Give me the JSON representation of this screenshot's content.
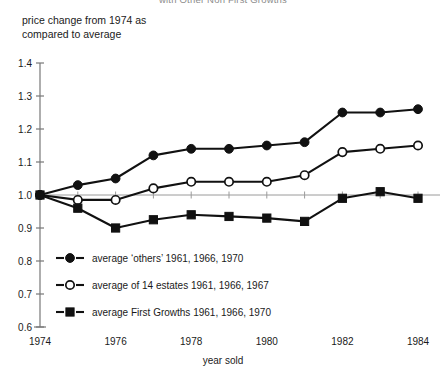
{
  "title_clipped": "with Other Non First Growths",
  "axis": {
    "y_title": "price change from 1974 as compared to average",
    "x_title": "year sold",
    "y_ticks": [
      "1.4",
      "1.3",
      "1.2",
      "1.1",
      "1.0",
      "0.9",
      "0.8",
      "0.7",
      "0.6"
    ],
    "x_ticks": [
      "1974",
      "1976",
      "1978",
      "1980",
      "1982",
      "1984"
    ]
  },
  "legend": {
    "items": [
      {
        "marker": "filled-circle",
        "label": "average ‘others’ 1961, 1966, 1970"
      },
      {
        "marker": "open-circle",
        "label": "average of 14 estates 1961, 1966, 1967"
      },
      {
        "marker": "filled-square",
        "label": "average First Growths 1961, 1966, 1970"
      }
    ]
  },
  "colors": {
    "ink": "#111111",
    "reference_line": "#9a9a9a",
    "axis": "#777777",
    "background": "#ffffff"
  },
  "chart_data": {
    "type": "line",
    "title": "with Other Non First Growths",
    "xlabel": "year sold",
    "ylabel": "price change from 1974 as compared to average",
    "x": [
      1974,
      1975,
      1976,
      1977,
      1978,
      1979,
      1980,
      1981,
      1982,
      1983,
      1984
    ],
    "xlim": [
      1974,
      1984
    ],
    "ylim": [
      0.6,
      1.4
    ],
    "ytick_step": 0.1,
    "grid": false,
    "reference_line_y": 1.0,
    "legend_position": "lower-left inside plot",
    "series": [
      {
        "name": "average ‘others’ 1961, 1966, 1970",
        "marker": "filled-circle",
        "values": [
          1.0,
          1.03,
          1.05,
          1.12,
          1.14,
          1.14,
          1.15,
          1.16,
          1.25,
          1.25,
          1.26
        ]
      },
      {
        "name": "average of 14 estates 1961, 1966, 1967",
        "marker": "open-circle",
        "values": [
          1.0,
          0.985,
          0.985,
          1.02,
          1.04,
          1.04,
          1.04,
          1.06,
          1.13,
          1.14,
          1.15
        ]
      },
      {
        "name": "average First Growths 1961, 1966, 1970",
        "marker": "filled-square",
        "values": [
          1.0,
          0.96,
          0.9,
          0.925,
          0.94,
          0.935,
          0.93,
          0.92,
          0.99,
          1.01,
          0.99
        ]
      }
    ]
  }
}
